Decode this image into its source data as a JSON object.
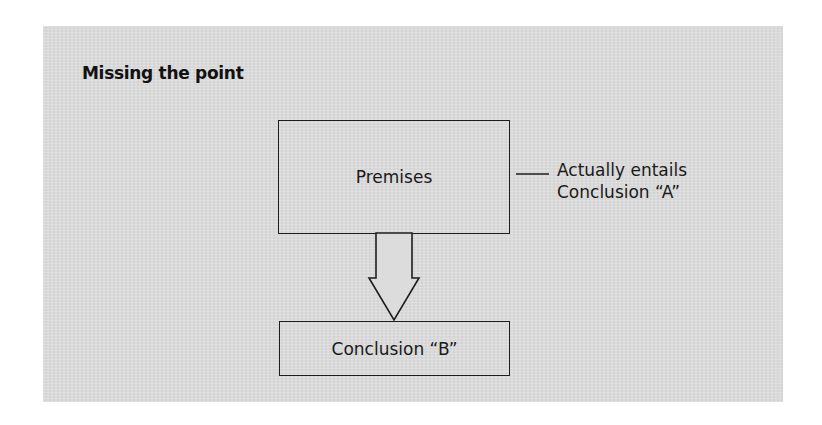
{
  "diagram": {
    "title": "Missing the point",
    "nodes": {
      "premises": {
        "label": "Premises"
      },
      "conclusion_b": {
        "label": "Conclusion “B”"
      }
    },
    "annotation": {
      "line1": "Actually entails",
      "line2": "Conclusion “A”"
    },
    "edges": [
      {
        "from": "premises",
        "to": "conclusion_b",
        "style": "hollow-block-arrow"
      },
      {
        "from": "premises",
        "to": "annotation",
        "style": "plain-line"
      }
    ],
    "colors": {
      "panel": "#dcdcdc",
      "stroke": "#1e1e1e",
      "text": "#1a1a1a",
      "page": "#ffffff"
    }
  }
}
